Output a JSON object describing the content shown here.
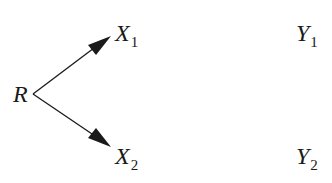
{
  "diagram": {
    "type": "directed-graph",
    "nodes": [
      {
        "id": "R",
        "label": "R",
        "subscript": ""
      },
      {
        "id": "X1",
        "label": "X",
        "subscript": "1"
      },
      {
        "id": "X2",
        "label": "X",
        "subscript": "2"
      },
      {
        "id": "Y1",
        "label": "Y",
        "subscript": "1"
      },
      {
        "id": "Y2",
        "label": "Y",
        "subscript": "2"
      }
    ],
    "edges": [
      {
        "from": "R",
        "to": "X1",
        "style": "arrow"
      },
      {
        "from": "R",
        "to": "X2",
        "style": "arrow"
      }
    ],
    "colors": {
      "ink": "#1a1a1a",
      "background": "#ffffff"
    }
  }
}
